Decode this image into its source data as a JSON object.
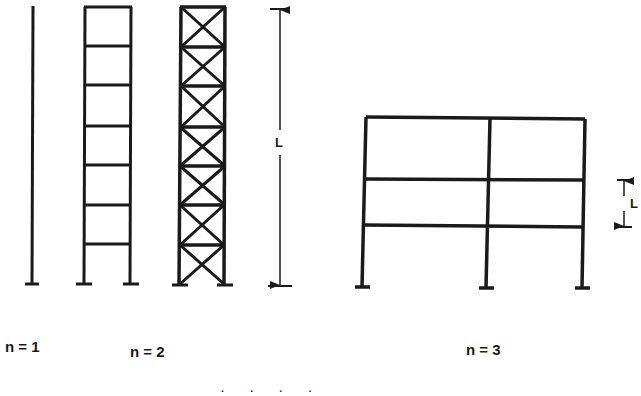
{
  "figure": {
    "structures": [
      {
        "id": "column",
        "label": "n = 1",
        "type": "single column"
      },
      {
        "id": "ladder-frame",
        "label": "n = 2",
        "type": "ladder frame",
        "panels": 7
      },
      {
        "id": "braced-tower",
        "label": "",
        "type": "X-braced tower",
        "panels": 7
      },
      {
        "id": "portal-frame",
        "label": "n = 3",
        "type": "two-bay three-story frame",
        "bays": 2,
        "stories": 3
      }
    ],
    "dimensions": {
      "full_height_label": "L",
      "story_height_label": "L"
    },
    "caption_partial": "· · · ·"
  },
  "colors": {
    "line": "#1a1a1a",
    "background": "#ffffff"
  }
}
